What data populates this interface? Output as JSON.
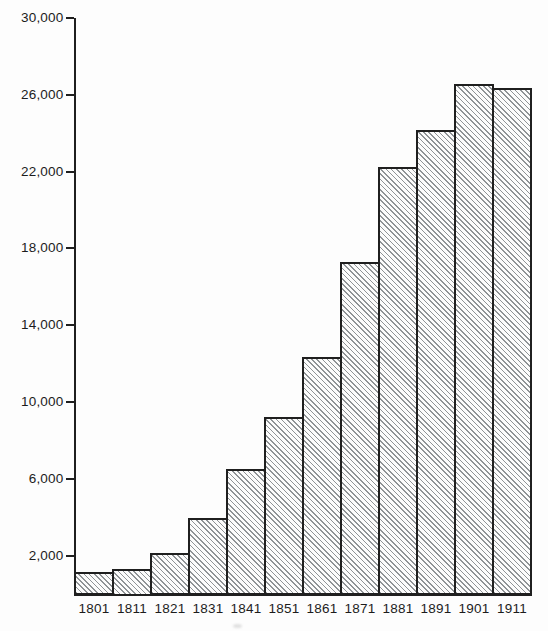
{
  "figure": {
    "background_color": "#fdfdfd",
    "ink_color": "#1f1f1f",
    "hatch_color": "#8f9396",
    "text_color": "#1c1c1c"
  },
  "chart_data": {
    "type": "bar",
    "title": "",
    "xlabel": "",
    "ylabel": "",
    "categories": [
      "1801",
      "1811",
      "1821",
      "1831",
      "1841",
      "1851",
      "1861",
      "1871",
      "1881",
      "1891",
      "1901",
      "1911"
    ],
    "values": [
      1100,
      1250,
      2100,
      3950,
      6500,
      9200,
      12300,
      17250,
      22200,
      24100,
      26500,
      26300
    ],
    "ylim": [
      0,
      30000
    ],
    "yticks": [
      2000,
      6000,
      10000,
      14000,
      18000,
      22000,
      26000,
      30000
    ],
    "ytick_labels": [
      "2,000",
      "6,000",
      "10,000",
      "14,000",
      "18,000",
      "22,000",
      "26,000",
      "30,000"
    ],
    "grid": false,
    "legend": null,
    "bar_style": "diagonal-hatch",
    "bar_gap": 0
  }
}
